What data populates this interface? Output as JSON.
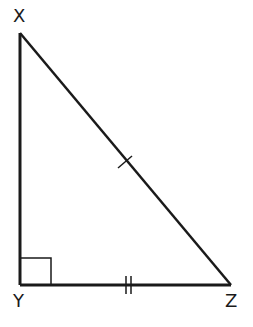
{
  "diagram": {
    "type": "right-triangle",
    "vertices": {
      "X": {
        "label": "X",
        "x": 20,
        "y": 33
      },
      "Y": {
        "label": "Y",
        "x": 20,
        "y": 285
      },
      "Z": {
        "label": "Z",
        "x": 231,
        "y": 285
      }
    },
    "right_angle_at": "Y",
    "markings": {
      "XZ": "single tick",
      "YZ": "double tick"
    },
    "colors": {
      "stroke": "#1a1a1a",
      "background": "#ffffff"
    }
  }
}
